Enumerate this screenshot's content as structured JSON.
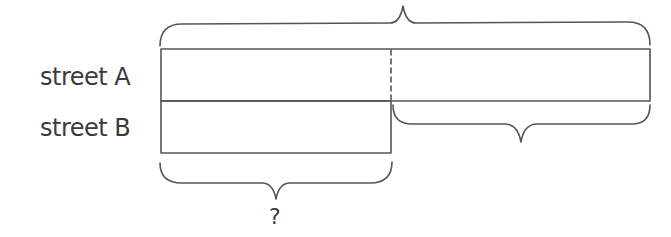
{
  "diagram": {
    "type": "bar-model",
    "rows": [
      {
        "label": "street A"
      },
      {
        "label": "street B"
      }
    ],
    "braces": {
      "top": {
        "label": "",
        "spans": "street A"
      },
      "right_difference": {
        "label": "",
        "spans": "street A minus street B"
      },
      "bottom": {
        "label": "?",
        "spans": "street B"
      }
    },
    "colors": {
      "stroke": "#555555",
      "text": "#3a3a3a",
      "background": "#ffffff"
    }
  }
}
